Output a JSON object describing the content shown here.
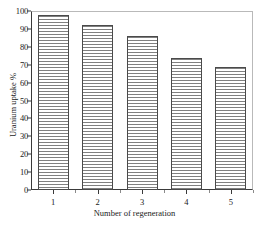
{
  "chart_data": {
    "type": "bar",
    "title": "",
    "xlabel": "Number of regeneration",
    "ylabel": "Uranium uptake %",
    "categories": [
      "1",
      "2",
      "3",
      "4",
      "5"
    ],
    "values": [
      98,
      92,
      86,
      74,
      69
    ],
    "ylim": [
      0,
      100
    ],
    "yticks": [
      0,
      10,
      20,
      30,
      40,
      50,
      60,
      70,
      80,
      90,
      100
    ],
    "ytick_labels": [
      "0",
      "10",
      "20",
      "30",
      "40",
      "50",
      "60",
      "70",
      "80",
      "90",
      "100"
    ],
    "xtick_labels": [
      "1",
      "2",
      "3",
      "4",
      "5"
    ],
    "grid": false,
    "legend": null,
    "bar_fill": "horizontal-hatch",
    "bar_edge_color": "#4a4a4a",
    "hatch_color": "#808080",
    "axis_color": "#3a3a3a",
    "frame_color": "#b9b9b9",
    "background": "#ffffff"
  }
}
